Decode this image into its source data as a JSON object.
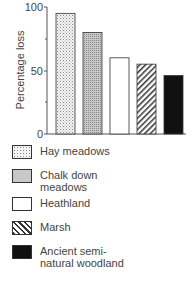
{
  "chart_data": {
    "type": "bar",
    "title": "",
    "xlabel": "",
    "ylabel": "Percentage loss",
    "ylim": [
      0,
      100
    ],
    "yticks": [
      0,
      50,
      100
    ],
    "grid": false,
    "legend_position": "below",
    "categories": [
      "Hay meadows",
      "Chalk down meadows",
      "Heathland",
      "Marsh",
      "Ancient semi-natural woodland"
    ],
    "values": [
      95,
      80,
      60,
      55,
      46
    ]
  },
  "legend": {
    "items": [
      {
        "line1": "Hay meadows",
        "line2": "",
        "pattern": "dots-light"
      },
      {
        "line1": "Chalk down",
        "line2": "meadows",
        "pattern": "dots-dense"
      },
      {
        "line1": "Heathland",
        "line2": "",
        "pattern": "white"
      },
      {
        "line1": "Marsh",
        "line2": "",
        "pattern": "hatch"
      },
      {
        "line1": "Ancient semi-",
        "line2": "natural woodland",
        "pattern": "black"
      }
    ]
  },
  "axis": {
    "ylabel": "Percentage loss",
    "t0": "0",
    "t50": "50",
    "t100": "100"
  }
}
